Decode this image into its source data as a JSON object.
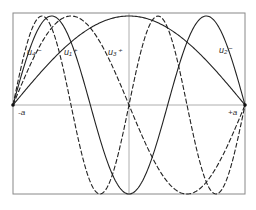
{
  "figure": {
    "frame": {
      "left": 13,
      "top": 13,
      "right": 245,
      "bottom": 194,
      "midline_y": 105,
      "center_x": 129
    },
    "axis_labels": {
      "left": "-a",
      "right": "+a"
    },
    "curves": [
      {
        "id": "u1",
        "label": "u₁⁺",
        "style": "solid",
        "half_waves": 1,
        "phase": "sin",
        "label_x": 64,
        "label_y": 55
      },
      {
        "id": "u2",
        "label": "u₂⁻",
        "style": "dashed",
        "half_waves": 2,
        "phase": "sin",
        "label_x": 219,
        "label_y": 53
      },
      {
        "id": "u3",
        "label": "u₃⁺",
        "style": "solid",
        "half_waves": 3,
        "phase": "sin",
        "label_x": 108,
        "label_y": 55
      },
      {
        "id": "u4",
        "label": "u₄⁻",
        "style": "dashed",
        "half_waves": 4,
        "phase": "sin",
        "label_x": 27,
        "label_y": 55
      }
    ],
    "colors": {
      "curve": "#222222",
      "frame": "#888888",
      "axis": "#999999",
      "background": "#ffffff"
    }
  }
}
